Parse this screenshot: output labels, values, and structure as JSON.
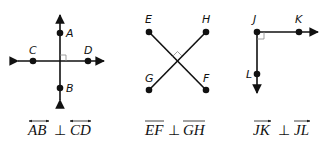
{
  "figures": [
    {
      "id": "lines",
      "points": {
        "A": "A",
        "B": "B",
        "C": "C",
        "D": "D"
      },
      "caption": {
        "left": "AB",
        "symbol": "⊥",
        "right": "CD",
        "notation": "line"
      }
    },
    {
      "id": "segments",
      "points": {
        "E": "E",
        "F": "F",
        "G": "G",
        "H": "H"
      },
      "caption": {
        "left": "EF",
        "symbol": "⊥",
        "right": "GH",
        "notation": "segment"
      }
    },
    {
      "id": "rays",
      "points": {
        "J": "J",
        "K": "K",
        "L": "L"
      },
      "caption": {
        "left": "JK",
        "symbol": "⊥",
        "right": "JL",
        "notation": "ray"
      }
    }
  ],
  "colors": {
    "stroke": "#111111",
    "right_angle_mark": "#888888"
  }
}
